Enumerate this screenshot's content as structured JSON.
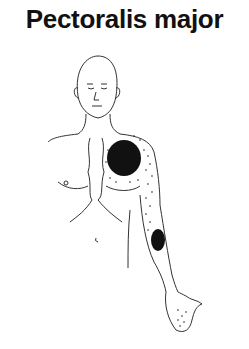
{
  "title": "Pectoralis major",
  "figure": {
    "referral_zones": [
      {
        "region": "chest",
        "intensity": "dense"
      },
      {
        "region": "shoulder",
        "intensity": "stippled"
      },
      {
        "region": "forearm",
        "intensity": "dense"
      },
      {
        "region": "hand",
        "intensity": "stippled"
      }
    ],
    "colors": {
      "ink": "#111111",
      "background": "#ffffff"
    }
  }
}
